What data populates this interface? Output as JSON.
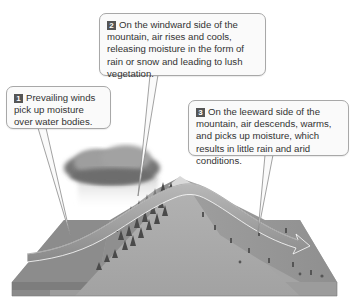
{
  "diagram": {
    "callouts": [
      {
        "number": "1",
        "text": "Prevailing winds pick up moisture over water bodies."
      },
      {
        "number": "2",
        "text": "On the windward side of the mountain, air rises and cools, releasing moisture in the form of rain or snow and leading to lush vegetation."
      },
      {
        "number": "3",
        "text": "On the leeward side of the mountain, air descends, warms, and picks up moisture, which results in little rain and arid conditions."
      }
    ],
    "elements": {
      "cloud": "rain-cloud",
      "mountain": "mountain-range",
      "water": "water-body",
      "wind_arrow": "prevailing-wind-arrow",
      "windward_side": "lush-vegetation-forest",
      "leeward_side": "arid-scrubland"
    },
    "colors": {
      "callout_fill": "#fafafa",
      "callout_border": "#a8a8a8",
      "badge": "#555555",
      "text": "#333333",
      "water": "#8c8c8c",
      "mountain": "#a9a9a9",
      "arrow": "#9a9a9a",
      "forest": "#4a4a4a"
    }
  }
}
